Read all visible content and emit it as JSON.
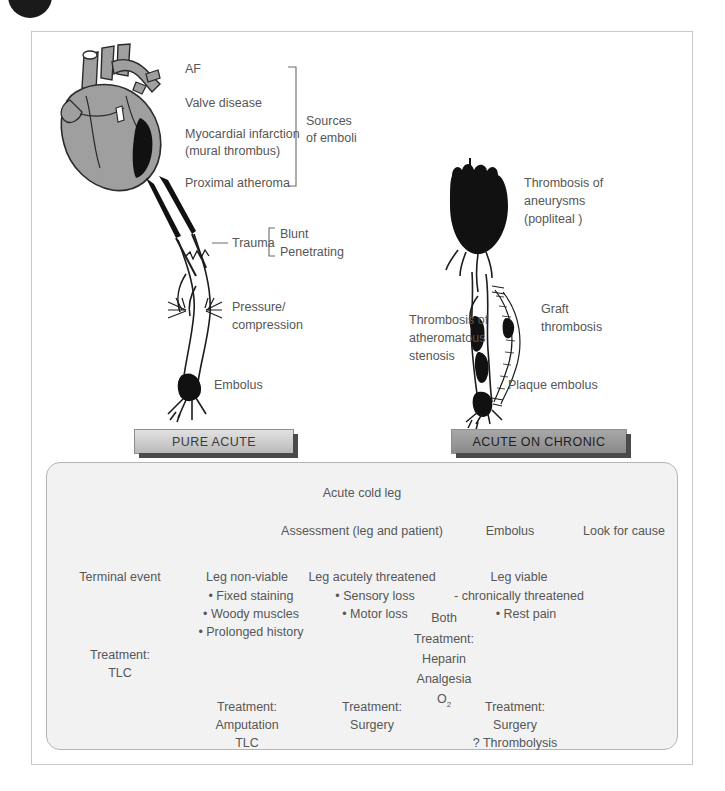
{
  "figure": {
    "corner_mark": "page-bullet"
  },
  "banners": {
    "left": "PURE ACUTE",
    "right": "ACUTE ON CHRONIC"
  },
  "heart_sources": {
    "items": [
      "AF",
      "Valve disease",
      "Myocardial infarction",
      "(mural thrombus)",
      "Proximal atheroma"
    ],
    "bracket_label_line1": "Sources",
    "bracket_label_line2": "of emboli"
  },
  "left_leg_labels": {
    "trauma": "Trauma",
    "trauma_types": [
      "Blunt",
      "Penetrating"
    ],
    "pressure_line1": "Pressure/",
    "pressure_line2": "compression",
    "embolus": "Embolus"
  },
  "right_leg_labels": {
    "aneurysm_line1": "Thrombosis of",
    "aneurysm_line2": "aneurysms",
    "aneurysm_line3": "(popliteal )",
    "stenosis_line1": "Thrombosis of",
    "stenosis_line2": "atheromatous",
    "stenosis_line3": "stenosis",
    "graft_line1": "Graft",
    "graft_line2": "thrombosis",
    "plaque": "Plaque embolus"
  },
  "flowchart": {
    "root": "Acute cold leg",
    "assessment": "Assessment (leg and patient)",
    "embolus": "Embolus",
    "look_for_cause": "Look for cause",
    "branches": [
      {
        "heading": "Terminal event",
        "bullets": [],
        "treatment": [
          "Treatment:",
          "TLC"
        ]
      },
      {
        "heading": "Leg non-viable",
        "bullets": [
          "• Fixed staining",
          "• Woody muscles",
          "• Prolonged history"
        ],
        "treatment": [
          "Treatment:",
          "Amputation",
          "TLC"
        ]
      },
      {
        "heading": "Leg acutely threatened",
        "bullets": [
          "• Sensory loss",
          "• Motor loss"
        ],
        "treatment": [
          "Treatment:",
          "Surgery"
        ]
      },
      {
        "heading": "Leg viable",
        "bullets": [
          "- chronically threatened",
          "• Rest pain"
        ],
        "treatment": [
          "Treatment:",
          "Surgery",
          "? Thrombolysis"
        ]
      }
    ],
    "both_label": "Both",
    "both_treatment_line1": "Treatment:",
    "both_treatment_line2": "Heparin",
    "both_treatment_line3": "Analgesia",
    "both_treatment_line4_base": "O",
    "both_treatment_line4_sub": "2"
  },
  "colors": {
    "heart_fill": "#9f9f9f",
    "infarct_black": "#111111",
    "panel_bg": "#f2f2f2",
    "frame": "#c9c9c9",
    "text": "#565656",
    "banner_light": "#d0d0d0",
    "banner_dark": "#9a9a9a"
  }
}
